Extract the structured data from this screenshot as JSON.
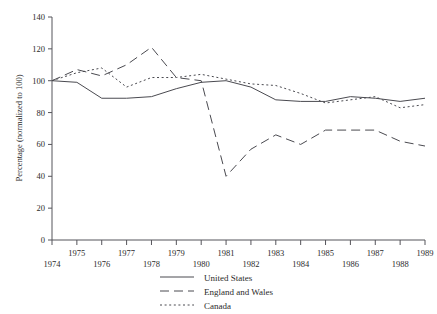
{
  "chart_data": {
    "type": "line",
    "title": "",
    "xlabel": "",
    "ylabel": "Percentage (normalized to 100)",
    "xlim": [
      1974,
      1989
    ],
    "ylim": [
      0,
      140
    ],
    "grid": false,
    "legend_position": "bottom-center",
    "x": [
      1974,
      1975,
      1976,
      1977,
      1978,
      1979,
      1980,
      1981,
      1982,
      1983,
      1984,
      1985,
      1986,
      1987,
      1988,
      1989
    ],
    "xtick_labels": [
      "1974",
      "1975",
      "1976",
      "1977",
      "1978",
      "1979",
      "1980",
      "1981",
      "1982",
      "1983",
      "1984",
      "1985",
      "1986",
      "1987",
      "1988",
      "1989"
    ],
    "ytick_labels": [
      "0",
      "20",
      "40",
      "60",
      "80",
      "100",
      "120",
      "140"
    ],
    "yticks": [
      0,
      20,
      40,
      60,
      80,
      100,
      120,
      140
    ],
    "series": [
      {
        "name": "United States",
        "style": "solid",
        "values": [
          100,
          99,
          89,
          89,
          90,
          95,
          99,
          100,
          96,
          88,
          87,
          87,
          90,
          89,
          87,
          89
        ]
      },
      {
        "name": "England and Wales",
        "style": "long-dash",
        "values": [
          100,
          107,
          103,
          110,
          121,
          102,
          100,
          40,
          57,
          66,
          60,
          69,
          69,
          69,
          62,
          59
        ]
      },
      {
        "name": "Canada",
        "style": "dotted",
        "values": [
          100,
          105,
          108,
          96,
          102,
          102,
          104,
          101,
          98,
          97,
          92,
          86,
          88,
          90,
          83,
          85
        ]
      }
    ]
  },
  "axes": {
    "y_axis_title": "Percentage (normalized to 100)"
  },
  "legend": {
    "entries": [
      {
        "label": "United States",
        "style": "solid"
      },
      {
        "label": "England and Wales",
        "style": "long-dash"
      },
      {
        "label": "Canada",
        "style": "dotted"
      }
    ]
  }
}
